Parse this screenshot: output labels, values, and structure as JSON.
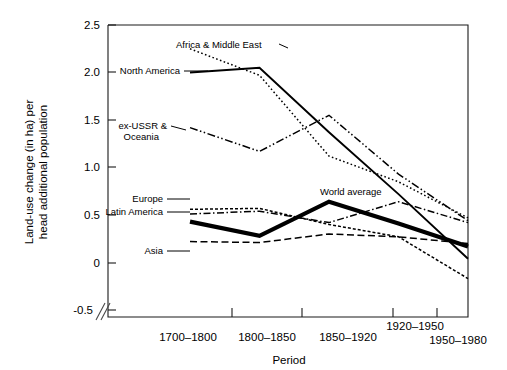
{
  "chart_data": {
    "type": "line",
    "title": "",
    "xlabel": "Period",
    "ylabel": "Land-use change (in ha) per head additional population",
    "categories": [
      "1700–1800",
      "1800–1850",
      "1850–1920",
      "1920–1950",
      "1950–1980"
    ],
    "ylim": [
      -0.5,
      2.5
    ],
    "yticks": [
      "2.5",
      "2.0",
      "1.5",
      "1.0",
      "0.5",
      "0",
      "-0.5"
    ],
    "ytick_values": [
      2.5,
      2.0,
      1.5,
      1.0,
      0.5,
      0.0,
      -0.5
    ],
    "grid": false,
    "legend": "inline-labels",
    "axis_break": true,
    "series": [
      {
        "name": "North America",
        "style": "solid",
        "values": [
          2.0,
          2.05,
          1.37,
          0.72,
          0.04
        ]
      },
      {
        "name": "Africa & Middle East",
        "style": "dotted",
        "values": [
          2.25,
          1.97,
          1.12,
          0.85,
          0.47
        ]
      },
      {
        "name": "ex-USSR & Oceania",
        "style": "dash-dot-dot",
        "values": [
          1.42,
          1.17,
          1.55,
          0.93,
          0.44
        ]
      },
      {
        "name": "Europe",
        "style": "fine-dot",
        "values": [
          0.56,
          0.57,
          0.4,
          0.27,
          -0.17
        ]
      },
      {
        "name": "Latin America",
        "style": "dash-dot",
        "values": [
          0.51,
          0.54,
          0.42,
          0.64,
          0.42
        ]
      },
      {
        "name": "Asia",
        "style": "dashed",
        "values": [
          0.22,
          0.21,
          0.3,
          0.27,
          0.2
        ]
      },
      {
        "name": "World average",
        "style": "thick-solid",
        "values": [
          0.43,
          0.28,
          0.64,
          0.41,
          0.17
        ]
      }
    ],
    "series_labels": [
      {
        "text": "North America",
        "x": 99,
        "y": 71
      },
      {
        "text": "Africa & Middle East",
        "x": 176,
        "y": 45
      },
      {
        "text": "ex-USSR &",
        "x": 107,
        "y": 126
      },
      {
        "text": "Oceania",
        "x": 125,
        "y": 137
      },
      {
        "text": "Europe",
        "x": 121,
        "y": 199
      },
      {
        "text": "Latin America",
        "x": 101,
        "y": 212
      },
      {
        "text": "Asia",
        "x": 133,
        "y": 251
      },
      {
        "text": "World average",
        "x": 320,
        "y": 192
      }
    ]
  }
}
